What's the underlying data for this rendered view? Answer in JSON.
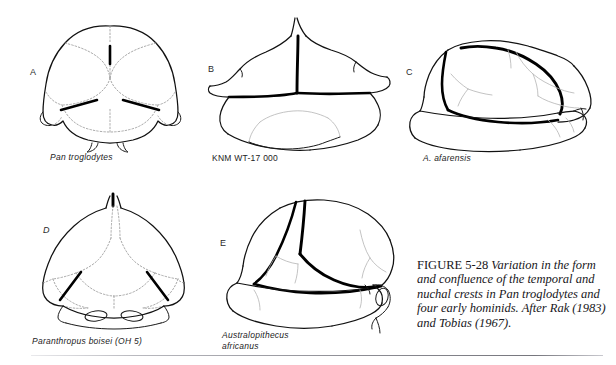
{
  "figure": {
    "number_label": "FIGURE 5-28",
    "caption_text": " Variation in the form and confluence of the temporal and nuchal crests in Pan troglodytes and four early hominids. After Rak (1983) and Tobias (1967).",
    "panels": [
      {
        "id": "a",
        "letter": "A",
        "letter_italic": false,
        "specimen": "Pan troglodytes",
        "specimen_italic": true,
        "view": "posterior-cranium"
      },
      {
        "id": "b",
        "letter": "B",
        "letter_italic": false,
        "specimen": "KNM WT-17 000",
        "specimen_italic": false,
        "view": "posterior-cranium"
      },
      {
        "id": "c",
        "letter": "C",
        "letter_italic": false,
        "specimen": "A. afarensis",
        "specimen_italic": true,
        "view": "lateral-cranium"
      },
      {
        "id": "d",
        "letter": "D",
        "letter_italic": true,
        "specimen": "Paranthropus boisei (OH 5)",
        "specimen_italic": true,
        "view": "posterior-cranium"
      },
      {
        "id": "e",
        "letter": "E",
        "letter_italic": false,
        "specimen": "Australopithecus\nafricanus",
        "specimen_italic": true,
        "view": "lateral-cranium"
      }
    ]
  },
  "colors": {
    "background": "#ffffff",
    "outline": "#111111",
    "crest": "#000000",
    "suture": "#9a9a9a",
    "caption_text": "#17161a",
    "rule": "#8f8f96"
  }
}
